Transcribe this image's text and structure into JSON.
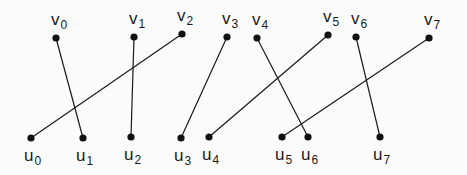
{
  "diagram": {
    "type": "bipartite-graph",
    "top_nodes": [
      {
        "id": "v0",
        "name": "v",
        "sub": "0",
        "x": 56,
        "y": 38
      },
      {
        "id": "v1",
        "name": "v",
        "sub": "1",
        "x": 134,
        "y": 37
      },
      {
        "id": "v2",
        "name": "v",
        "sub": "2",
        "x": 182,
        "y": 34
      },
      {
        "id": "v3",
        "name": "v",
        "sub": "3",
        "x": 227,
        "y": 37
      },
      {
        "id": "v4",
        "name": "v",
        "sub": "4",
        "x": 257,
        "y": 38
      },
      {
        "id": "v5",
        "name": "v",
        "sub": "5",
        "x": 328,
        "y": 35
      },
      {
        "id": "v6",
        "name": "v",
        "sub": "6",
        "x": 356,
        "y": 37
      },
      {
        "id": "v7",
        "name": "v",
        "sub": "7",
        "x": 429,
        "y": 38
      }
    ],
    "bottom_nodes": [
      {
        "id": "u0",
        "name": "u",
        "sub": "0",
        "x": 31,
        "y": 138
      },
      {
        "id": "u1",
        "name": "u",
        "sub": "1",
        "x": 83,
        "y": 138
      },
      {
        "id": "u2",
        "name": "u",
        "sub": "2",
        "x": 131,
        "y": 137
      },
      {
        "id": "u3",
        "name": "u",
        "sub": "3",
        "x": 181,
        "y": 138
      },
      {
        "id": "u4",
        "name": "u",
        "sub": "4",
        "x": 209,
        "y": 137
      },
      {
        "id": "u5",
        "name": "u",
        "sub": "5",
        "x": 282,
        "y": 137
      },
      {
        "id": "u6",
        "name": "u",
        "sub": "6",
        "x": 308,
        "y": 137
      },
      {
        "id": "u7",
        "name": "u",
        "sub": "7",
        "x": 380,
        "y": 137
      }
    ],
    "edges": [
      {
        "from": "v0",
        "to": "u1"
      },
      {
        "from": "v1",
        "to": "u2"
      },
      {
        "from": "v2",
        "to": "u0"
      },
      {
        "from": "v3",
        "to": "u3"
      },
      {
        "from": "v4",
        "to": "u6"
      },
      {
        "from": "v5",
        "to": "u4"
      },
      {
        "from": "v6",
        "to": "u7"
      },
      {
        "from": "v7",
        "to": "u5"
      }
    ],
    "colors": {
      "line": "#1a1a1a",
      "node": "#111111",
      "background": "#fbfbfb"
    }
  }
}
